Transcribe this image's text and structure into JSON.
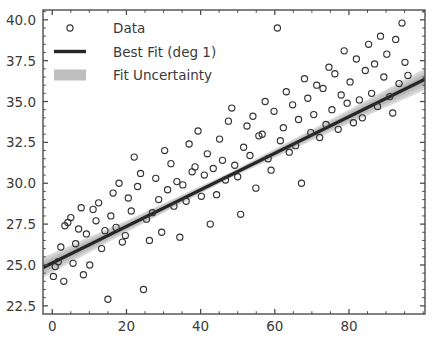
{
  "chart_data": {
    "type": "scatter",
    "title": "",
    "xlabel": "",
    "ylabel": "",
    "xlim": [
      -2.5,
      100.5
    ],
    "ylim": [
      22.0,
      40.6
    ],
    "xticks": [
      0,
      20,
      40,
      60,
      80
    ],
    "xticklabels": [
      "0",
      "20",
      "40",
      "60",
      "80"
    ],
    "yticks": [
      22.5,
      25.0,
      27.5,
      30.0,
      32.5,
      35.0,
      37.5,
      40.0
    ],
    "yticklabels": [
      "22.5",
      "25.0",
      "27.5",
      "30.0",
      "32.5",
      "35.0",
      "37.5",
      "40.0"
    ],
    "grid": false,
    "minor_ticks": true,
    "legend_position": "upper left",
    "legend_frame": false,
    "series": [
      {
        "name": "Data",
        "type": "scatter",
        "marker": "open-circle",
        "color": "#333333",
        "x": [
          0.3,
          0.8,
          1.6,
          2.3,
          3.1,
          3.4,
          4.2,
          5.0,
          5.6,
          6.3,
          7.1,
          7.8,
          8.4,
          9.2,
          10.1,
          11.0,
          11.8,
          12.5,
          13.3,
          14.2,
          15.0,
          15.8,
          16.4,
          17.2,
          18.0,
          18.9,
          19.7,
          20.5,
          21.3,
          22.1,
          23.0,
          23.8,
          24.6,
          25.4,
          26.2,
          27.0,
          27.9,
          28.7,
          29.5,
          30.3,
          31.1,
          32.0,
          32.8,
          33.6,
          34.4,
          35.2,
          36.1,
          36.9,
          37.7,
          38.5,
          39.3,
          40.2,
          41.0,
          41.8,
          42.6,
          43.4,
          44.3,
          45.1,
          45.9,
          46.7,
          47.5,
          48.4,
          49.2,
          50.0,
          50.8,
          51.6,
          52.5,
          53.3,
          54.1,
          54.9,
          55.7,
          56.6,
          57.4,
          58.2,
          59.0,
          59.8,
          60.7,
          61.5,
          62.3,
          63.1,
          63.9,
          64.8,
          65.6,
          66.4,
          67.2,
          68.0,
          68.9,
          69.7,
          70.5,
          71.3,
          72.1,
          73.0,
          73.8,
          74.6,
          75.4,
          76.2,
          77.1,
          77.9,
          78.7,
          79.5,
          80.3,
          81.2,
          82.0,
          82.8,
          83.6,
          84.4,
          85.3,
          86.1,
          86.9,
          87.7,
          88.5,
          89.4,
          90.2,
          91.0,
          91.8,
          92.6,
          93.5,
          94.3,
          95.1,
          95.9
        ],
        "y": [
          24.3,
          24.9,
          25.2,
          26.1,
          24.0,
          27.4,
          27.6,
          27.9,
          25.1,
          26.3,
          27.2,
          28.5,
          24.4,
          26.9,
          25.0,
          28.4,
          27.7,
          28.8,
          26.0,
          27.1,
          22.9,
          28.0,
          29.4,
          27.3,
          30.0,
          26.4,
          26.8,
          29.1,
          28.3,
          31.6,
          29.8,
          30.6,
          23.5,
          27.8,
          26.5,
          28.2,
          30.3,
          29.0,
          27.0,
          32.0,
          29.6,
          31.2,
          28.6,
          30.1,
          26.7,
          29.9,
          28.9,
          32.4,
          30.7,
          31.0,
          33.2,
          29.2,
          30.5,
          31.8,
          27.5,
          30.9,
          29.3,
          32.7,
          31.4,
          30.2,
          33.8,
          34.6,
          31.1,
          30.4,
          28.1,
          32.2,
          33.5,
          31.7,
          34.1,
          29.7,
          32.9,
          33.0,
          35.0,
          31.5,
          30.8,
          34.4,
          39.5,
          32.6,
          33.4,
          35.6,
          31.9,
          34.8,
          32.3,
          33.9,
          30.0,
          36.4,
          35.2,
          33.1,
          34.2,
          36.0,
          32.8,
          35.8,
          33.6,
          37.1,
          34.5,
          36.7,
          33.3,
          35.4,
          38.1,
          34.9,
          36.2,
          33.7,
          37.6,
          35.1,
          34.0,
          36.9,
          38.5,
          35.5,
          37.3,
          34.7,
          39.0,
          36.5,
          37.9,
          35.3,
          34.3,
          38.8,
          36.1,
          39.8,
          37.4,
          36.6
        ]
      },
      {
        "name": "Best Fit (deg 1)",
        "type": "line",
        "color": "#262626",
        "linewidth": 3.2,
        "slope": 0.1119,
        "intercept": 25.12,
        "x_endpoints": [
          -2.5,
          100.5
        ],
        "y_endpoints": [
          24.84,
          36.36
        ]
      },
      {
        "name": "Fit Uncertainty",
        "type": "band",
        "color": "#bfbfbf",
        "center_slope": 0.1119,
        "center_intercept": 25.12,
        "half_width_at_x": [
          {
            "x": -2.5,
            "half_width": 0.62
          },
          {
            "x": 20.0,
            "half_width": 0.36
          },
          {
            "x": 48.0,
            "half_width": 0.18
          },
          {
            "x": 75.0,
            "half_width": 0.38
          },
          {
            "x": 100.5,
            "half_width": 0.66
          }
        ]
      }
    ]
  },
  "legend": {
    "items": [
      {
        "label": "Data",
        "marker": "open-circle"
      },
      {
        "label": "Best Fit (deg 1)",
        "marker": "line"
      },
      {
        "label": "Fit Uncertainty",
        "marker": "band"
      }
    ]
  }
}
